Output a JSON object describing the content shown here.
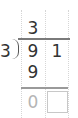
{
  "problem": {
    "divisor": "3",
    "dividend_digits": [
      "9",
      "1"
    ],
    "quotient_digits": [
      "3",
      ""
    ],
    "subtract_row": [
      "9",
      ""
    ],
    "remainder_row": [
      "0",
      ""
    ]
  },
  "colors": {
    "digit": "#333333",
    "remainder_digit": "#b5b5b5",
    "rule": "#7a7a7a",
    "grid": "#d6d6d6"
  }
}
